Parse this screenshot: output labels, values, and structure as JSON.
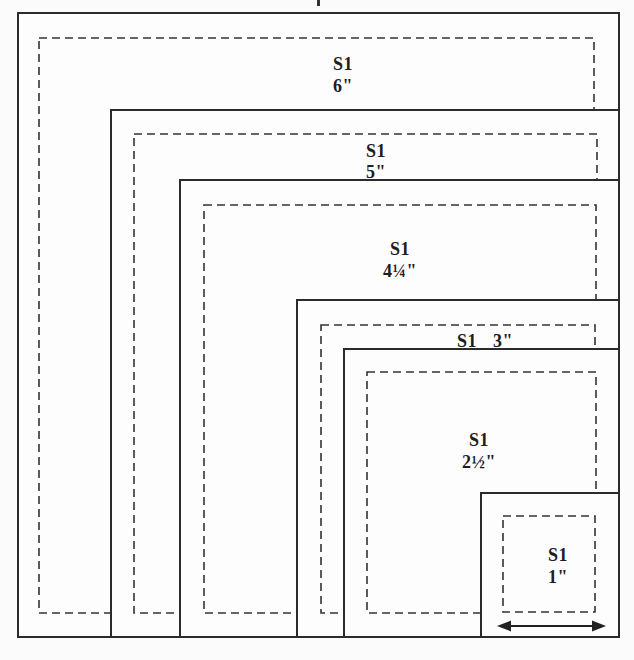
{
  "diagram": {
    "description_colors": {
      "background": "#fbfbfb",
      "line_color": "#2b2b2b",
      "text_color": "#1e1e1e"
    },
    "squares": [
      {
        "name": "6-inch",
        "label": "S1",
        "size": "6\""
      },
      {
        "name": "5-inch",
        "label": "S1",
        "size": "5\""
      },
      {
        "name": "4.25-inch",
        "label": "S1",
        "size": "4¼\""
      },
      {
        "name": "3-inch",
        "label": "S1",
        "size": "3\""
      },
      {
        "name": "2.5-inch",
        "label": "S1",
        "size": "2½\""
      },
      {
        "name": "1-inch",
        "label": "S1",
        "size": "1\""
      }
    ]
  }
}
